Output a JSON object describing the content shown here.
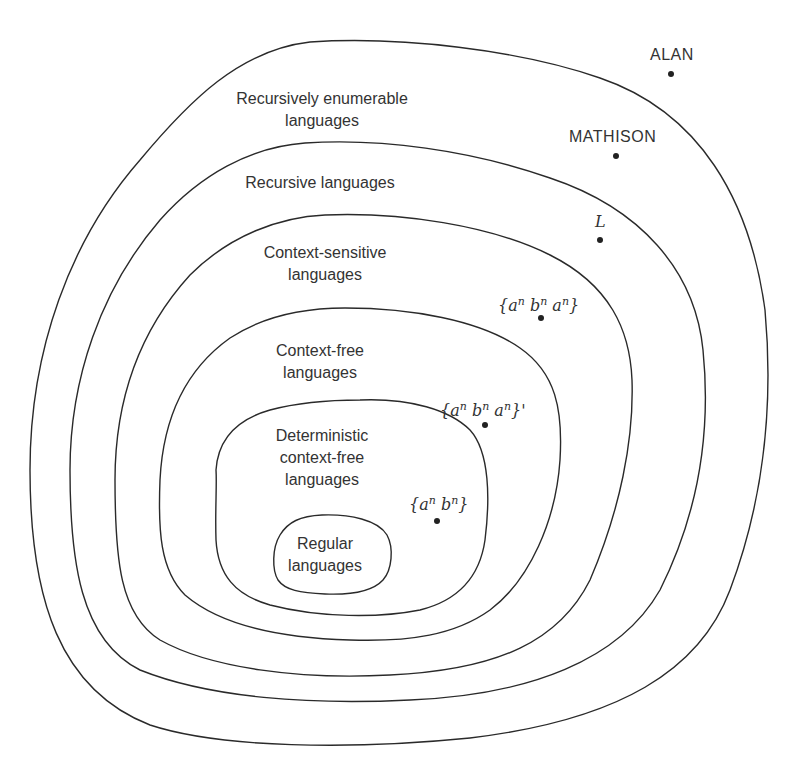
{
  "diagram": {
    "type": "nested-sets",
    "sets": [
      {
        "id": "re",
        "label_line1": "Recursively enumerable",
        "label_line2": "languages"
      },
      {
        "id": "recursive",
        "label_line1": "Recursive languages"
      },
      {
        "id": "cs",
        "label_line1": "Context-sensitive",
        "label_line2": "languages"
      },
      {
        "id": "cf",
        "label_line1": "Context-free",
        "label_line2": "languages"
      },
      {
        "id": "dcf",
        "label_line1": "Deterministic",
        "label_line2": "context-free",
        "label_line3": "languages"
      },
      {
        "id": "regular",
        "label_line1": "Regular",
        "label_line2": "languages"
      }
    ],
    "points": [
      {
        "id": "alan",
        "label": "ALAN",
        "region": "outside all"
      },
      {
        "id": "mathison",
        "label": "MATHISON",
        "region": "recursively enumerable, not recursive"
      },
      {
        "id": "L",
        "label": "L",
        "region": "recursive, not context-sensitive"
      },
      {
        "id": "anbnan",
        "label": "{aⁿ bⁿ aⁿ}",
        "region": "context-sensitive, not context-free"
      },
      {
        "id": "anbnan_complement",
        "label": "{aⁿ bⁿ aⁿ}'",
        "region": "context-free, not deterministic"
      },
      {
        "id": "anbn",
        "label": "{aⁿ bⁿ}",
        "region": "deterministic context-free, not regular"
      }
    ],
    "math": {
      "a": "a",
      "b": "b",
      "n": "n",
      "lbrace": "{",
      "rbrace": "}",
      "prime": "'"
    }
  }
}
